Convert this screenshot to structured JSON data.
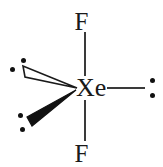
{
  "figure": {
    "central_atom": "Xe",
    "ligands": [
      "F",
      "F"
    ],
    "lone_pairs": 3,
    "geometry": "linear",
    "colors": {
      "stroke": "#1a1a1a",
      "bond": "#3a3a3a",
      "dot": "#111111",
      "background": "#ffffff"
    }
  },
  "atoms": {
    "center": "Xe",
    "fluorine_top": "F",
    "fluorine_bottom": "F"
  },
  "icons": {
    "hollow_wedge": "hollow-wedge-icon",
    "solid_wedge": "solid-wedge-icon",
    "bond_line": "bond-line-icon",
    "lone_pair_dot": "lone-pair-dot-icon"
  }
}
